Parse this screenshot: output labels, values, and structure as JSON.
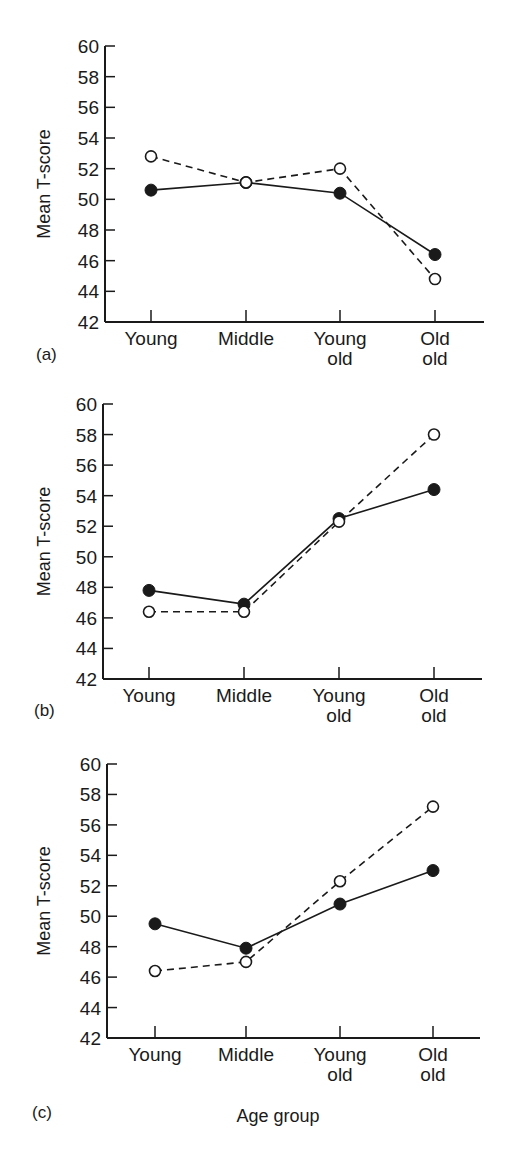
{
  "chart_data": [
    {
      "type": "line",
      "panel": "(a)",
      "categories": [
        "Young",
        "Middle",
        "Young old",
        "Old old"
      ],
      "category_lines": [
        [
          "Young"
        ],
        [
          "Middle"
        ],
        [
          "Young",
          "old"
        ],
        [
          "Old",
          "old"
        ]
      ],
      "series": [
        {
          "name": "filled",
          "marker": "filled-circle",
          "line": "solid",
          "values": [
            50.6,
            51.1,
            50.4,
            46.4
          ]
        },
        {
          "name": "open",
          "marker": "open-circle",
          "line": "dashed",
          "values": [
            52.8,
            51.1,
            52.0,
            44.8
          ]
        }
      ],
      "ylabel": "Mean T-score",
      "xlabel": "",
      "ylim": [
        42,
        60
      ],
      "yticks": [
        42,
        44,
        46,
        48,
        50,
        52,
        54,
        56,
        58,
        60
      ],
      "grid": false,
      "legend": "none"
    },
    {
      "type": "line",
      "panel": "(b)",
      "categories": [
        "Young",
        "Middle",
        "Young old",
        "Old old"
      ],
      "category_lines": [
        [
          "Young"
        ],
        [
          "Middle"
        ],
        [
          "Young",
          "old"
        ],
        [
          "Old",
          "old"
        ]
      ],
      "series": [
        {
          "name": "filled",
          "marker": "filled-circle",
          "line": "solid",
          "values": [
            47.8,
            46.9,
            52.5,
            54.4
          ]
        },
        {
          "name": "open",
          "marker": "open-circle",
          "line": "dashed",
          "values": [
            46.4,
            46.4,
            52.3,
            58.0
          ]
        }
      ],
      "ylabel": "Mean T-score",
      "xlabel": "",
      "ylim": [
        42,
        60
      ],
      "yticks": [
        42,
        44,
        46,
        48,
        50,
        52,
        54,
        56,
        58,
        60
      ],
      "grid": false,
      "legend": "none"
    },
    {
      "type": "line",
      "panel": "(c)",
      "categories": [
        "Young",
        "Middle",
        "Young old",
        "Old old"
      ],
      "category_lines": [
        [
          "Young"
        ],
        [
          "Middle"
        ],
        [
          "Young",
          "old"
        ],
        [
          "Old",
          "old"
        ]
      ],
      "series": [
        {
          "name": "filled",
          "marker": "filled-circle",
          "line": "solid",
          "values": [
            49.5,
            47.9,
            50.8,
            53.0
          ]
        },
        {
          "name": "open",
          "marker": "open-circle",
          "line": "dashed",
          "values": [
            46.4,
            47.0,
            52.3,
            57.2
          ]
        }
      ],
      "ylabel": "Mean T-score",
      "xlabel": "Age group",
      "ylim": [
        42,
        60
      ],
      "yticks": [
        42,
        44,
        46,
        48,
        50,
        52,
        54,
        56,
        58,
        60
      ],
      "grid": false,
      "legend": "none"
    }
  ],
  "layout": {
    "panels": [
      {
        "top": 46,
        "bottom": 322,
        "axis_left": 105,
        "axis_right": 484,
        "xs": [
          151,
          246,
          340,
          435
        ],
        "label_x": 36,
        "label_y": 360
      },
      {
        "top": 404,
        "bottom": 679,
        "axis_left": 103,
        "axis_right": 482,
        "xs": [
          149,
          244,
          339,
          434
        ],
        "label_x": 34,
        "label_y": 716
      },
      {
        "top": 764,
        "bottom": 1038,
        "axis_left": 107,
        "axis_right": 480,
        "xs": [
          155,
          246,
          340,
          433
        ],
        "label_x": 32,
        "label_y": 1118
      }
    ],
    "x_title_pos": {
      "x": 278,
      "y": 1122
    }
  }
}
